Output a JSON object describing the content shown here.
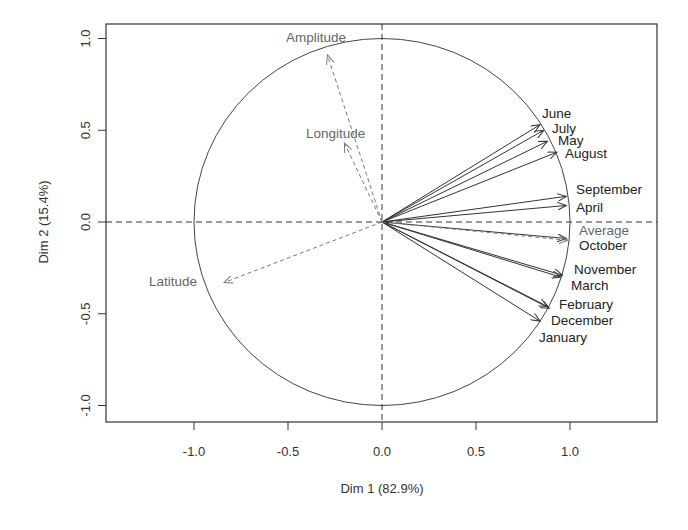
{
  "chart_data": {
    "type": "scatter",
    "subtype": "pca-variables-correlation-circle",
    "title": "",
    "xlabel": "Dim 1 (82.9%)",
    "ylabel": "Dim 2 (15.4%)",
    "xlim": [
      -1.45,
      1.45
    ],
    "ylim": [
      -1.09,
      1.08
    ],
    "x_ticks": [
      -1.0,
      -0.5,
      0.0,
      0.5,
      1.0
    ],
    "x_tick_labels": [
      "-1.0",
      "-0.5",
      "0.0",
      "0.5",
      "1.0"
    ],
    "y_ticks": [
      -1.0,
      -0.5,
      0.0,
      0.5,
      1.0
    ],
    "y_tick_labels": [
      "-1.0",
      "-0.5",
      "0.0",
      "0.5",
      "1.0"
    ],
    "grid": false,
    "legend": null,
    "unit_circle": true,
    "reference_lines": [
      "x=0 dashed",
      "y=0 dashed"
    ],
    "series": [
      {
        "name": "active variables",
        "style": "solid arrows",
        "color": "#333333",
        "points": [
          {
            "label": "June",
            "x": 0.84,
            "y": 0.53
          },
          {
            "label": "July",
            "x": 0.86,
            "y": 0.5
          },
          {
            "label": "May",
            "x": 0.88,
            "y": 0.44
          },
          {
            "label": "August",
            "x": 0.93,
            "y": 0.38
          },
          {
            "label": "September",
            "x": 0.98,
            "y": 0.14
          },
          {
            "label": "April",
            "x": 0.98,
            "y": 0.09
          },
          {
            "label": "October",
            "x": 0.98,
            "y": -0.09
          },
          {
            "label": "November",
            "x": 0.96,
            "y": -0.29
          },
          {
            "label": "March",
            "x": 0.95,
            "y": -0.3
          },
          {
            "label": "February",
            "x": 0.88,
            "y": -0.46
          },
          {
            "label": "December",
            "x": 0.89,
            "y": -0.47
          },
          {
            "label": "January",
            "x": 0.84,
            "y": -0.54
          }
        ]
      },
      {
        "name": "supplementary variables",
        "style": "dashed arrows",
        "color": "#777777",
        "points": [
          {
            "label": "Average",
            "x": 0.99,
            "y": -0.1
          },
          {
            "label": "Amplitude",
            "x": -0.29,
            "y": 0.91
          },
          {
            "label": "Longitude",
            "x": -0.2,
            "y": 0.43
          },
          {
            "label": "Latitude",
            "x": -0.84,
            "y": -0.33
          }
        ]
      }
    ],
    "labels_placement": [
      {
        "label": "June",
        "px": 542,
        "py": 118
      },
      {
        "label": "July",
        "px": 552,
        "py": 133
      },
      {
        "label": "May",
        "px": 558,
        "py": 145
      },
      {
        "label": "August",
        "px": 565,
        "py": 158
      },
      {
        "label": "September",
        "px": 576,
        "py": 194
      },
      {
        "label": "April",
        "px": 576,
        "py": 212
      },
      {
        "label": "Average",
        "px": 579,
        "py": 235
      },
      {
        "label": "October",
        "px": 579,
        "py": 250
      },
      {
        "label": "November",
        "px": 574,
        "py": 274
      },
      {
        "label": "March",
        "px": 571,
        "py": 290
      },
      {
        "label": "February",
        "px": 559,
        "py": 309
      },
      {
        "label": "December",
        "px": 551,
        "py": 325
      },
      {
        "label": "January",
        "px": 539,
        "py": 342
      },
      {
        "label": "Amplitude",
        "px": 286,
        "py": 42
      },
      {
        "label": "Longitude",
        "px": 306,
        "py": 138
      },
      {
        "label": "Latitude",
        "px": 149,
        "py": 286
      }
    ]
  },
  "colors": {
    "axis": "#333333",
    "active_arrow": "#333333",
    "supp_arrow": "#777777",
    "circle": "#444444",
    "background": "#ffffff"
  }
}
